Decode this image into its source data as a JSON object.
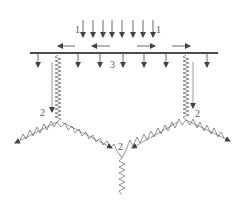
{
  "diagram": {
    "type": "structural-load-diagram",
    "colors": {
      "line": "#222222",
      "hatch": "#666666",
      "arrow": "#444444",
      "background": "#ffffff"
    },
    "labels": {
      "top_left": "1",
      "top_right": "1",
      "plate": "3",
      "left_junction": "2",
      "right_junction": "2",
      "bottom_junction": "2"
    },
    "top_load_arrows_x": [
      83,
      93,
      103,
      112,
      122,
      133,
      143,
      153
    ],
    "plate_arrows_x": [
      38,
      78,
      100,
      123,
      144,
      166,
      207
    ],
    "horizontal_arrows": [
      {
        "direction": "left",
        "x1": 75,
        "x2": 58
      },
      {
        "direction": "left",
        "x1": 110,
        "x2": 92
      },
      {
        "direction": "right",
        "x1": 137,
        "x2": 155
      },
      {
        "direction": "right",
        "x1": 172,
        "x2": 190
      }
    ]
  }
}
